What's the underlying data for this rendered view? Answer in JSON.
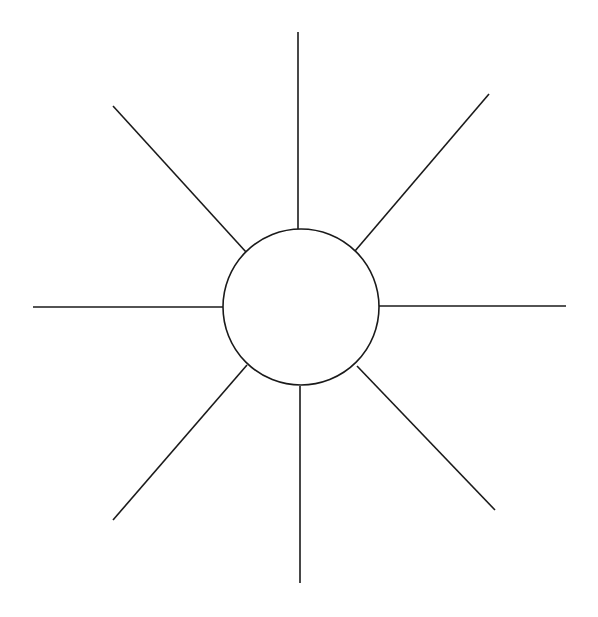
{
  "diagram": {
    "title": "",
    "type": "radial-spoke-diagram",
    "background": "#ffffff",
    "stroke_color": "#1a1a1a",
    "hub": {
      "label": "",
      "cx": 301,
      "cy": 307,
      "r": 78
    },
    "spokes": [
      {
        "name": "top",
        "label": "",
        "x1": 298,
        "y1": 32,
        "x2": 298,
        "y2": 229
      },
      {
        "name": "top-right",
        "label": "",
        "x1": 489,
        "y1": 94,
        "x2": 355,
        "y2": 251
      },
      {
        "name": "right",
        "label": "",
        "x1": 379,
        "y1": 306,
        "x2": 566,
        "y2": 306
      },
      {
        "name": "bottom-right",
        "label": "",
        "x1": 357,
        "y1": 366,
        "x2": 495,
        "y2": 510
      },
      {
        "name": "bottom",
        "label": "",
        "x1": 300,
        "y1": 386,
        "x2": 300,
        "y2": 583
      },
      {
        "name": "bottom-left",
        "label": "",
        "x1": 247,
        "y1": 365,
        "x2": 113,
        "y2": 520
      },
      {
        "name": "left",
        "label": "",
        "x1": 33,
        "y1": 307,
        "x2": 223,
        "y2": 307
      },
      {
        "name": "top-left",
        "label": "",
        "x1": 113,
        "y1": 106,
        "x2": 246,
        "y2": 252
      }
    ]
  }
}
